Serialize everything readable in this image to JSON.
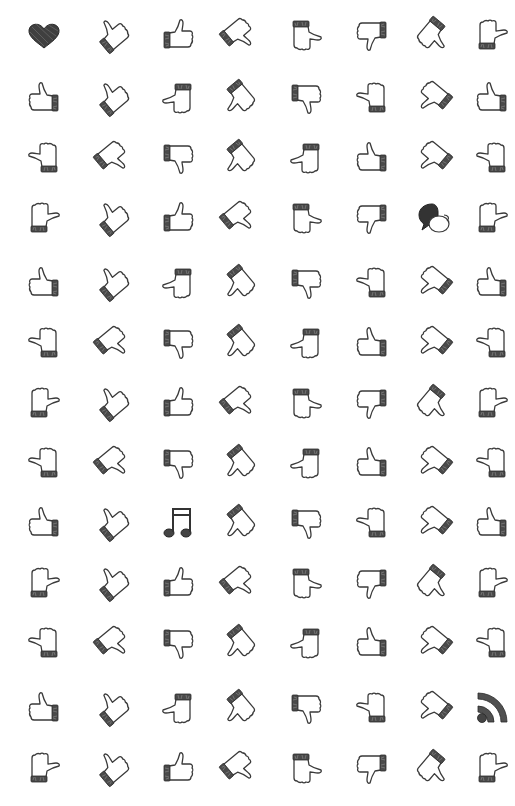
{
  "canvas": {
    "width": 515,
    "height": 806,
    "background": "#ffffff"
  },
  "grid": {
    "columns_x": [
      44,
      112,
      178,
      238,
      306,
      372,
      434,
      492
    ],
    "rows_y": [
      35,
      98,
      158,
      218,
      283,
      343,
      403,
      463,
      523,
      583,
      643,
      708,
      768
    ]
  },
  "colors": {
    "ink": "#3a3a3a",
    "cuff": "#4a4a4a"
  },
  "variants": {
    "up-cuff-right": {
      "rot": 0,
      "flip": true
    },
    "up-cuff-left": {
      "rot": 0,
      "flip": false
    },
    "up-tilt-cuff-bl": {
      "rot": -40,
      "flip": false
    },
    "up-tilt-cuff-br": {
      "rot": 40,
      "flip": true
    },
    "down-cuff-left": {
      "rot": 180,
      "flip": true
    },
    "down-cuff-right": {
      "rot": 180,
      "flip": false
    },
    "left-cuff-top": {
      "rot": -90,
      "flip": false
    },
    "left-cuff-bottom": {
      "rot": 90,
      "flip": true
    },
    "right-cuff-top": {
      "rot": 90,
      "flip": false
    },
    "right-cuff-bottom": {
      "rot": -90,
      "flip": true
    },
    "tilt-cuff-tl": {
      "rot": 140,
      "flip": true
    },
    "tilt-cuff-tr": {
      "rot": -140,
      "flip": false
    },
    "tilt-cuff-bl-down": {
      "rot": -130,
      "flip": true
    },
    "tilt-cuff-br-left": {
      "rot": 130,
      "flip": false
    }
  },
  "rows": [
    [
      "heart",
      "up-tilt-cuff-bl",
      "up-cuff-left",
      "tilt-cuff-tl",
      "right-cuff-top",
      "down-cuff-right",
      "tilt-cuff-br-left",
      "left-cuff-bottom"
    ],
    [
      "up-cuff-right",
      "up-tilt-cuff-bl",
      "right-cuff-bottom",
      "tilt-cuff-bl-down",
      "down-cuff-left",
      "left-cuff-top",
      "tilt-cuff-tr",
      "up-cuff-right"
    ],
    [
      "left-cuff-top",
      "tilt-cuff-tl",
      "down-cuff-left",
      "tilt-cuff-bl-down",
      "right-cuff-bottom",
      "up-cuff-right",
      "tilt-cuff-tr",
      "left-cuff-top"
    ],
    [
      "left-cuff-bottom",
      "up-tilt-cuff-bl",
      "up-cuff-left",
      "tilt-cuff-tl",
      "right-cuff-top",
      "down-cuff-right",
      "chat",
      "left-cuff-bottom"
    ],
    [
      "up-cuff-right",
      "up-tilt-cuff-bl",
      "right-cuff-bottom",
      "tilt-cuff-bl-down",
      "down-cuff-left",
      "left-cuff-top",
      "tilt-cuff-tr",
      "up-cuff-right"
    ],
    [
      "left-cuff-top",
      "tilt-cuff-tl",
      "down-cuff-left",
      "tilt-cuff-bl-down",
      "right-cuff-bottom",
      "up-cuff-right",
      "tilt-cuff-tr",
      "left-cuff-top"
    ],
    [
      "left-cuff-bottom",
      "up-tilt-cuff-bl",
      "up-cuff-left",
      "tilt-cuff-tl",
      "right-cuff-top",
      "down-cuff-right",
      "tilt-cuff-br-left",
      "left-cuff-bottom"
    ],
    [
      "left-cuff-top",
      "tilt-cuff-tl",
      "down-cuff-left",
      "tilt-cuff-bl-down",
      "right-cuff-bottom",
      "up-cuff-right",
      "tilt-cuff-tr",
      "left-cuff-top"
    ],
    [
      "up-cuff-right",
      "up-tilt-cuff-bl",
      "music",
      "tilt-cuff-bl-down",
      "down-cuff-left",
      "left-cuff-top",
      "tilt-cuff-tr",
      "up-cuff-right"
    ],
    [
      "left-cuff-bottom",
      "up-tilt-cuff-bl",
      "up-cuff-left",
      "tilt-cuff-tl",
      "right-cuff-top",
      "down-cuff-right",
      "tilt-cuff-br-left",
      "left-cuff-bottom"
    ],
    [
      "left-cuff-top",
      "tilt-cuff-tl",
      "down-cuff-left",
      "tilt-cuff-bl-down",
      "right-cuff-bottom",
      "up-cuff-right",
      "tilt-cuff-tr",
      "left-cuff-top"
    ],
    [
      "up-cuff-right",
      "up-tilt-cuff-bl",
      "right-cuff-bottom",
      "tilt-cuff-bl-down",
      "down-cuff-left",
      "left-cuff-top",
      "tilt-cuff-tr",
      "rss"
    ],
    [
      "left-cuff-bottom",
      "up-tilt-cuff-bl",
      "up-cuff-left",
      "tilt-cuff-tl",
      "right-cuff-top",
      "down-cuff-right",
      "tilt-cuff-br-left",
      "left-cuff-bottom"
    ]
  ],
  "icon_names": {
    "heart": "heart-icon",
    "chat": "speech-bubbles-icon",
    "music": "music-note-icon",
    "rss": "rss-feed-icon",
    "thumb": "thumb-hand-icon"
  }
}
